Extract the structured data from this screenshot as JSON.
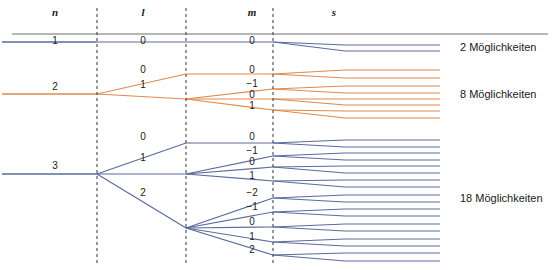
{
  "figure": {
    "width": 558,
    "height": 270,
    "background": "#ffffff"
  },
  "colors": {
    "orange": "#e08a4e",
    "blue": "#5a6b9e",
    "rule": "#6e6e6e",
    "dashed": "#333333",
    "text": "#1a1a1a"
  },
  "headers": [
    {
      "label": "n",
      "x": 55,
      "y": 13
    },
    {
      "label": "l",
      "x": 143,
      "y": 13
    },
    {
      "label": "m",
      "x": 252,
      "y": 13
    },
    {
      "label": "s",
      "x": 334,
      "y": 13
    }
  ],
  "rule": {
    "x1": 12,
    "x2": 548,
    "y": 34
  },
  "dividers": [
    {
      "name": "divider-n-l",
      "x": 97,
      "y1": 8,
      "y2": 265
    },
    {
      "name": "divider-l-m",
      "x": 186,
      "y1": 8,
      "y2": 265
    },
    {
      "name": "divider-m-s",
      "x": 273,
      "y1": 8,
      "y2": 265
    }
  ],
  "shells": [
    {
      "name": "shell-n-1",
      "n": "1",
      "color": "#5a6b9e",
      "trunk_y": 42,
      "n_label": {
        "text": "1",
        "x": 55,
        "y": 42
      },
      "subshells": [
        {
          "l": "0",
          "l_label": {
            "text": "0",
            "x": 143,
            "y": 42
          },
          "l_y": 42,
          "orbitals": [
            {
              "m": "0",
              "m_label": {
                "text": "0",
                "x": 252,
                "y": 42
              },
              "m_y": 42,
              "spins": [
                {
                  "s": "+1/2",
                  "y": 45
                },
                {
                  "s": "-1/2",
                  "y": 51
                }
              ]
            }
          ]
        }
      ],
      "count_label": {
        "text": "2 Möglichkeiten",
        "x": 460,
        "y": 49
      }
    },
    {
      "name": "shell-n-2",
      "n": "2",
      "color": "#e08a4e",
      "trunk_y": 94,
      "n_label": {
        "text": "2",
        "x": 55,
        "y": 88
      },
      "subshells": [
        {
          "l": "0",
          "l_label": {
            "text": "0",
            "x": 143,
            "y": 71
          },
          "l_y": 74,
          "orbitals": [
            {
              "m": "0",
              "m_label": {
                "text": "0",
                "x": 252,
                "y": 71
              },
              "m_y": 74,
              "spins": [
                {
                  "s": "+1/2",
                  "y": 70
                },
                {
                  "s": "-1/2",
                  "y": 78
                }
              ]
            }
          ]
        },
        {
          "l": "1",
          "l_label": {
            "text": "1",
            "x": 143,
            "y": 86
          },
          "l_y": 99,
          "orbitals": [
            {
              "m": "-1",
              "m_label": {
                "text": "−1",
                "x": 252,
                "y": 85
              },
              "m_y": 89,
              "spins": [
                {
                  "s": "+1/2",
                  "y": 86
                },
                {
                  "s": "-1/2",
                  "y": 93
                }
              ]
            },
            {
              "m": "0",
              "m_label": {
                "text": "0",
                "x": 252,
                "y": 96
              },
              "m_y": 99,
              "spins": [
                {
                  "s": "+1/2",
                  "y": 99
                },
                {
                  "s": "-1/2",
                  "y": 105
                }
              ]
            },
            {
              "m": "1",
              "m_label": {
                "text": "1",
                "x": 252,
                "y": 107
              },
              "m_y": 110,
              "spins": [
                {
                  "s": "+1/2",
                  "y": 111
                },
                {
                  "s": "-1/2",
                  "y": 118
                }
              ]
            }
          ]
        }
      ],
      "count_label": {
        "text": "8 Möglichkeiten",
        "x": 460,
        "y": 96
      }
    },
    {
      "name": "shell-n-3",
      "n": "3",
      "color": "#5a6b9e",
      "trunk_y": 174,
      "n_label": {
        "text": "3",
        "x": 55,
        "y": 167
      },
      "subshells": [
        {
          "l": "0",
          "l_label": {
            "text": "0",
            "x": 143,
            "y": 138
          },
          "l_y": 143,
          "orbitals": [
            {
              "m": "0",
              "m_label": {
                "text": "0",
                "x": 252,
                "y": 138
              },
              "m_y": 143,
              "spins": [
                {
                  "s": "+1/2",
                  "y": 140
                },
                {
                  "s": "-1/2",
                  "y": 147
                }
              ]
            }
          ]
        },
        {
          "l": "1",
          "l_label": {
            "text": "1",
            "x": 143,
            "y": 159
          },
          "l_y": 174,
          "orbitals": [
            {
              "m": "-1",
              "m_label": {
                "text": "−1",
                "x": 252,
                "y": 152
              },
              "m_y": 156,
              "spins": [
                {
                  "s": "+1/2",
                  "y": 153
                },
                {
                  "s": "-1/2",
                  "y": 160
                }
              ]
            },
            {
              "m": "0",
              "m_label": {
                "text": "0",
                "x": 252,
                "y": 163
              },
              "m_y": 167,
              "spins": [
                {
                  "s": "+1/2",
                  "y": 166
                },
                {
                  "s": "-1/2",
                  "y": 173
                }
              ]
            },
            {
              "m": "1",
              "m_label": {
                "text": "1",
                "x": 252,
                "y": 177
              },
              "m_y": 181,
              "spins": [
                {
                  "s": "+1/2",
                  "y": 180
                },
                {
                  "s": "-1/2",
                  "y": 187
                }
              ]
            }
          ]
        },
        {
          "l": "2",
          "l_label": {
            "text": "2",
            "x": 143,
            "y": 194
          },
          "l_y": 228,
          "orbitals": [
            {
              "m": "-2",
              "m_label": {
                "text": "−2",
                "x": 252,
                "y": 194
              },
              "m_y": 198,
              "spins": [
                {
                  "s": "+1/2",
                  "y": 195
                },
                {
                  "s": "-1/2",
                  "y": 202
                }
              ]
            },
            {
              "m": "-1",
              "m_label": {
                "text": "−1",
                "x": 252,
                "y": 208
              },
              "m_y": 212,
              "spins": [
                {
                  "s": "+1/2",
                  "y": 209
                },
                {
                  "s": "-1/2",
                  "y": 216
                }
              ]
            },
            {
              "m": "0",
              "m_label": {
                "text": "0",
                "x": 252,
                "y": 223
              },
              "m_y": 227,
              "spins": [
                {
                  "s": "+1/2",
                  "y": 224
                },
                {
                  "s": "-1/2",
                  "y": 231
                }
              ]
            },
            {
              "m": "1",
              "m_label": {
                "text": "1",
                "x": 252,
                "y": 238
              },
              "m_y": 242,
              "spins": [
                {
                  "s": "+1/2",
                  "y": 239
                },
                {
                  "s": "-1/2",
                  "y": 246
                }
              ]
            },
            {
              "m": "2",
              "m_label": {
                "text": "2",
                "x": 252,
                "y": 251
              },
              "m_y": 255,
              "spins": [
                {
                  "s": "+1/2",
                  "y": 253
                },
                {
                  "s": "-1/2",
                  "y": 261
                }
              ]
            }
          ]
        }
      ],
      "count_label": {
        "text": "18 Möglichkeiten",
        "x": 460,
        "y": 200
      }
    }
  ],
  "geometry": {
    "trunk_start_x": 2,
    "n_split_x": 97,
    "l_arrive_x": 186,
    "m_split_x": 186,
    "m_arrive_x": 273,
    "s_split_x": 273,
    "s_flat_x": 345,
    "line_end_x": 440
  }
}
